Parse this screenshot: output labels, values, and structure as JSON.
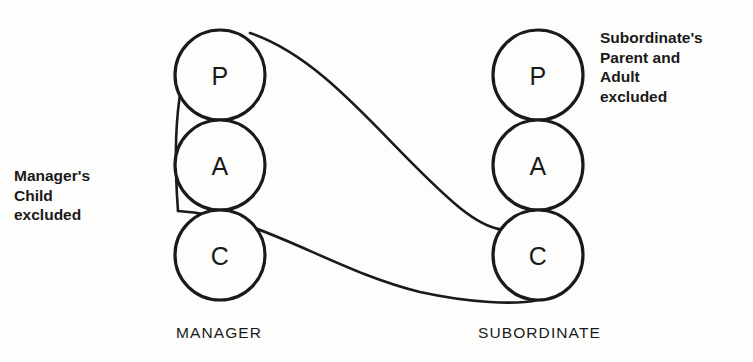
{
  "diagram": {
    "type": "transactional-analysis-crossed-transaction",
    "columns": [
      {
        "id": "manager",
        "caption": "MANAGER",
        "center_x": 220,
        "ego_states": [
          {
            "code": "P",
            "name": "Parent",
            "cx": 220,
            "cy": 75,
            "r": 45
          },
          {
            "code": "A",
            "name": "Adult",
            "cx": 220,
            "cy": 165,
            "r": 45
          },
          {
            "code": "C",
            "name": "Child",
            "cx": 220,
            "cy": 255,
            "r": 45
          }
        ]
      },
      {
        "id": "subordinate",
        "caption": "SUBORDINATE",
        "center_x": 538,
        "ego_states": [
          {
            "code": "P",
            "name": "Parent",
            "cx": 538,
            "cy": 75,
            "r": 45
          },
          {
            "code": "A",
            "name": "Adult",
            "cx": 538,
            "cy": 165,
            "r": 45
          },
          {
            "code": "C",
            "name": "Child",
            "cx": 538,
            "cy": 255,
            "r": 45
          }
        ]
      }
    ],
    "notes": {
      "manager": "Manager's\nChild\nexcluded",
      "subordinate": "Subordinate's\nParent and\nAdult\nexcluded"
    },
    "curves": {
      "upper_transaction": {
        "from": "manager-parent",
        "to": "subordinate-child",
        "path": "M 250 33 C 330 60, 390 150, 460 208 C 490 232, 515 240, 538 210"
      },
      "lower_transaction": {
        "from": "manager-adult-child-junction",
        "to": "subordinate-child-bottom",
        "path": "M 178 211 C 260 215, 330 270, 420 292 C 470 303, 515 305, 538 300"
      },
      "bypass_arc": {
        "from": "manager-parent-top",
        "to": "manager-adult-child-junction",
        "path": "M 206 33 C 178 55, 172 130, 178 211"
      }
    },
    "colors": {
      "ink": "#1a1a1a",
      "background": "#fdfdfc"
    }
  }
}
